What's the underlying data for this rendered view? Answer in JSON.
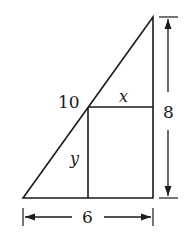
{
  "diagram": {
    "type": "geometry",
    "colors": {
      "stroke": "#1a1a1a",
      "background": "#ffffff"
    },
    "labels": {
      "hypotenuse_segment": "10",
      "top_segment": "x",
      "left_segment": "y",
      "height": "8",
      "base": "6"
    },
    "shapes": {
      "triangle": [
        [
          23,
          198
        ],
        [
          153,
          198
        ],
        [
          153,
          17
        ]
      ],
      "rectangle": {
        "x": 88,
        "y": 107,
        "width": 65,
        "height": 91
      }
    }
  }
}
